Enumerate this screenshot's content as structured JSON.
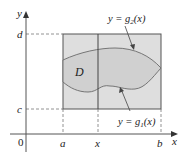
{
  "figure": {
    "axes": {
      "x_label": "x",
      "y_label": "y",
      "origin_label": "0"
    },
    "x_ticks": [
      {
        "label": "a"
      },
      {
        "label": "x"
      },
      {
        "label": "b"
      }
    ],
    "y_ticks": [
      {
        "label": "d"
      },
      {
        "label": "c"
      }
    ],
    "region_label": "D",
    "curves": {
      "upper": {
        "label_prefix": "y = g",
        "subscript": "2",
        "suffix": "(x)"
      },
      "lower": {
        "label_prefix": "y = g",
        "subscript": "1",
        "suffix": "(x)"
      }
    },
    "colors": {
      "rectangle_fill": "#dcdcdc",
      "region_fill": "#cfcfcf",
      "stroke": "#555555",
      "dashed": "#777777"
    }
  }
}
